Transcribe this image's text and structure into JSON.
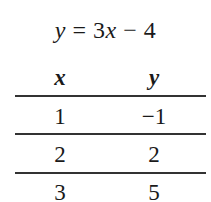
{
  "equation": {
    "lhs": "y",
    "middle": " = 3",
    "var": "x",
    "rhs": " − 4"
  },
  "table": {
    "headers": [
      "x",
      "y"
    ],
    "rows": [
      [
        "1",
        "−1"
      ],
      [
        "2",
        "2"
      ],
      [
        "3",
        "5"
      ]
    ]
  }
}
